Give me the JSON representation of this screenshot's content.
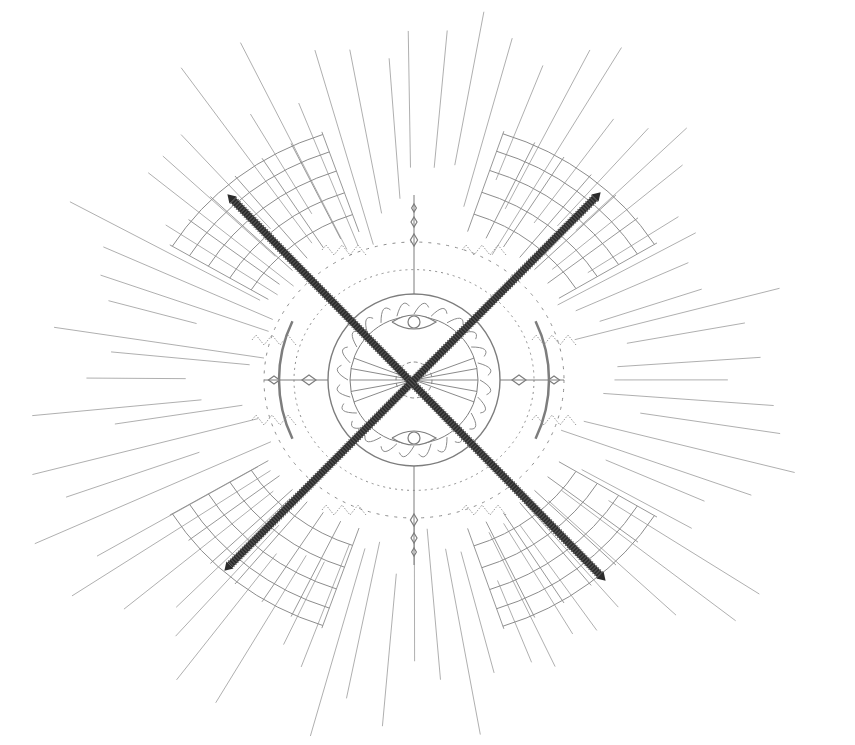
{
  "illustration": {
    "subject": "compass mandala with crossed swords",
    "background": "#ffffff",
    "colors": {
      "ray": "#9a9a9a",
      "ring": "#8c8c8c",
      "ornament": "#7d7d7d",
      "sword": "#2b2b2b",
      "sword_serration": "#555555"
    },
    "center": [
      414,
      380
    ],
    "medallion_radius": 86,
    "sword_a": {
      "from": [
        233,
        200
      ],
      "to": [
        600,
        575
      ]
    },
    "sword_b": {
      "from": [
        595,
        198
      ],
      "to": [
        230,
        565
      ]
    }
  }
}
